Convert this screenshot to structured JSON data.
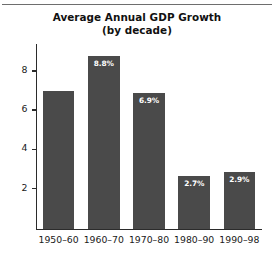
{
  "chart_data": {
    "type": "bar",
    "title": "Average Annual GDP Growth",
    "subtitle": "(by decade)",
    "xlabel": "",
    "ylabel": "",
    "categories": [
      "1950–60",
      "1960–70",
      "1970–80",
      "1980–90",
      "1990–98"
    ],
    "values": [
      7.0,
      8.8,
      6.9,
      2.7,
      2.9
    ],
    "data_labels": [
      "",
      "8.8%",
      "6.9%",
      "2.7%",
      "2.9%"
    ],
    "ylim": [
      0,
      9.4
    ],
    "yticks": [
      2,
      4,
      6,
      8
    ],
    "ytick_labels": [
      "2",
      "4",
      "6",
      "8"
    ],
    "grid": false,
    "legend": null,
    "bar_color": "#4a4a4a",
    "label_color": "#ffffff",
    "axis_color": "#2b2b2b"
  },
  "figure": {
    "top_rule_color": "#6e6e6e",
    "background": "#ffffff"
  }
}
